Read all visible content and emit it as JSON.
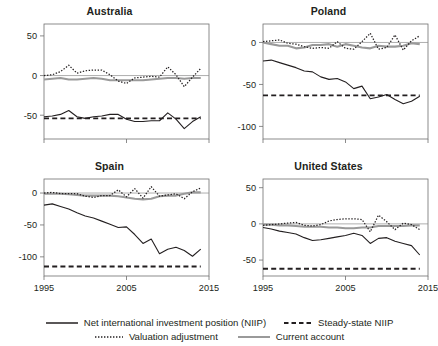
{
  "figure": {
    "background": "#ffffff",
    "text_color": "#231f20"
  },
  "legend": {
    "items": [
      {
        "key": "solid-dark-line",
        "label": "Net international investment position (NIIP)",
        "color": "#231f20",
        "style": "solid"
      },
      {
        "key": "dashed-dark-line",
        "label": "Steady-state NIIP",
        "color": "#231f20",
        "style": "dashed"
      },
      {
        "key": "dotted-dark-line",
        "label": "Valuation adjustment",
        "color": "#231f20",
        "style": "dotted"
      },
      {
        "key": "solid-gray-line",
        "label": "Current account",
        "color": "#9a9a9a",
        "style": "solid"
      }
    ]
  },
  "chart_data": [
    {
      "type": "line",
      "title": "Australia",
      "xlabel": "",
      "ylabel": "",
      "xlim": [
        1995,
        2015
      ],
      "ylim": [
        -80,
        65
      ],
      "xticks": [
        1995,
        2005,
        2015
      ],
      "xticklabels": [
        "1995",
        "2005",
        "2015"
      ],
      "yticks": [
        50,
        0,
        -50
      ],
      "yticklabels": [
        "50",
        "0",
        "-50"
      ],
      "grid": false,
      "zero_line": true,
      "show_xticklabels": false,
      "x": [
        1995,
        1996,
        1997,
        1998,
        1999,
        2000,
        2001,
        2002,
        2003,
        2004,
        2005,
        2006,
        2007,
        2008,
        2009,
        2010,
        2011,
        2012,
        2013,
        2014
      ],
      "series": [
        {
          "name": "Net international investment position (NIIP)",
          "style": "solid",
          "color": "#231f20",
          "values": [
            -52,
            -51,
            -49,
            -44,
            -52,
            -54,
            -52,
            -51,
            -49,
            -49,
            -55,
            -58,
            -58,
            -57,
            -57,
            -47,
            -55,
            -67,
            -58,
            -52
          ]
        },
        {
          "name": "Steady-state NIIP",
          "style": "dashed",
          "color": "#231f20",
          "values": [
            -54,
            -54,
            -54,
            -54,
            -54,
            -54,
            -54,
            -54,
            -54,
            -54,
            -54,
            -54,
            -54,
            -54,
            -54,
            -54,
            -54,
            -54,
            -54,
            -54
          ]
        },
        {
          "name": "Valuation adjustment",
          "style": "dotted",
          "color": "#231f20",
          "values": [
            0,
            1,
            5,
            13,
            3,
            6,
            7,
            7,
            1,
            -7,
            -10,
            -3,
            -2,
            -1,
            -2,
            11,
            1,
            -14,
            -2,
            9
          ]
        },
        {
          "name": "Current account",
          "style": "solid",
          "color": "#9a9a9a",
          "values": [
            -5,
            -4,
            -3,
            -5,
            -5,
            -4,
            -3,
            -4,
            -6,
            -6,
            -6,
            -6,
            -6,
            -5,
            -4,
            -3,
            -3,
            -4,
            -3,
            -3
          ]
        }
      ]
    },
    {
      "type": "line",
      "title": "Poland",
      "xlabel": "",
      "ylabel": "",
      "xlim": [
        1995,
        2015
      ],
      "ylim": [
        -115,
        22
      ],
      "xticks": [
        1995,
        2005,
        2015
      ],
      "xticklabels": [
        "1995",
        "2005",
        "2015"
      ],
      "yticks": [
        0,
        -50,
        -100
      ],
      "yticklabels": [
        "0",
        "-50",
        "-100"
      ],
      "grid": false,
      "zero_line": true,
      "show_xticklabels": false,
      "x": [
        1995,
        1996,
        1997,
        1998,
        1999,
        2000,
        2001,
        2002,
        2003,
        2004,
        2005,
        2006,
        2007,
        2008,
        2009,
        2010,
        2011,
        2012,
        2013,
        2014
      ],
      "series": [
        {
          "name": "Net international investment position (NIIP)",
          "style": "solid",
          "color": "#231f20",
          "values": [
            -22,
            -21,
            -24,
            -27,
            -30,
            -34,
            -35,
            -41,
            -44,
            -43,
            -47,
            -55,
            -52,
            -67,
            -65,
            -62,
            -68,
            -73,
            -70,
            -64
          ]
        },
        {
          "name": "Steady-state NIIP",
          "style": "dashed",
          "color": "#231f20",
          "values": [
            -63,
            -63,
            -63,
            -63,
            -63,
            -63,
            -63,
            -63,
            -63,
            -63,
            -63,
            -63,
            -63,
            -63,
            -63,
            -63,
            -63,
            -63,
            -63,
            -63
          ]
        },
        {
          "name": "Valuation adjustment",
          "style": "dotted",
          "color": "#231f20",
          "values": [
            1,
            2,
            3,
            -1,
            -2,
            -5,
            -7,
            -6,
            -7,
            1,
            -7,
            -8,
            1,
            11,
            -8,
            -6,
            9,
            -9,
            2,
            8
          ]
        },
        {
          "name": "Current account",
          "style": "solid",
          "color": "#9a9a9a",
          "values": [
            0,
            -2,
            -4,
            -4,
            -7,
            -6,
            -3,
            -3,
            -2,
            -5,
            -2,
            -4,
            -6,
            -7,
            -4,
            -5,
            -5,
            -4,
            -1,
            -2
          ]
        }
      ]
    },
    {
      "type": "line",
      "title": "Spain",
      "xlabel": "",
      "ylabel": "",
      "xlim": [
        1995,
        2015
      ],
      "ylim": [
        -130,
        22
      ],
      "xticks": [
        1995,
        2005,
        2015
      ],
      "xticklabels": [
        "1995",
        "2005",
        "2015"
      ],
      "yticks": [
        0,
        -50,
        -100
      ],
      "yticklabels": [
        "0",
        "-50",
        "-100"
      ],
      "grid": false,
      "zero_line": true,
      "show_xticklabels": true,
      "x": [
        1995,
        1996,
        1997,
        1998,
        1999,
        2000,
        2001,
        2002,
        2003,
        2004,
        2005,
        2006,
        2007,
        2008,
        2009,
        2010,
        2011,
        2012,
        2013,
        2014
      ],
      "series": [
        {
          "name": "Net international investment position (NIIP)",
          "style": "solid",
          "color": "#231f20",
          "values": [
            -19,
            -17,
            -21,
            -25,
            -31,
            -36,
            -39,
            -44,
            -49,
            -54,
            -53,
            -65,
            -79,
            -72,
            -95,
            -88,
            -85,
            -90,
            -99,
            -88
          ]
        },
        {
          "name": "Steady-state NIIP",
          "style": "dashed",
          "color": "#231f20",
          "values": [
            -115,
            -115,
            -115,
            -115,
            -115,
            -115,
            -115,
            -115,
            -115,
            -115,
            -115,
            -115,
            -115,
            -115,
            -115,
            -115,
            -115,
            -115,
            -115,
            -115
          ]
        },
        {
          "name": "Valuation adjustment",
          "style": "dotted",
          "color": "#231f20",
          "values": [
            0,
            1,
            -1,
            -1,
            -1,
            -5,
            -7,
            -4,
            -4,
            5,
            -6,
            7,
            -8,
            10,
            -5,
            -3,
            -1,
            -9,
            2,
            8
          ]
        },
        {
          "name": "Current account",
          "style": "solid",
          "color": "#9a9a9a",
          "values": [
            -1,
            -1,
            -1,
            -2,
            -3,
            -4,
            -4,
            -4,
            -4,
            -5,
            -7,
            -9,
            -10,
            -9,
            -5,
            -4,
            -4,
            -1,
            1,
            1
          ]
        }
      ]
    },
    {
      "type": "line",
      "title": "United States",
      "xlabel": "",
      "ylabel": "",
      "xlim": [
        1995,
        2015
      ],
      "ylim": [
        -72,
        62
      ],
      "xticks": [
        1995,
        2005,
        2015
      ],
      "xticklabels": [
        "1995",
        "2005",
        "2015"
      ],
      "yticks": [
        50,
        0,
        -50
      ],
      "yticklabels": [
        "50",
        "0",
        "-50"
      ],
      "grid": false,
      "zero_line": true,
      "show_xticklabels": true,
      "x": [
        1995,
        1996,
        1997,
        1998,
        1999,
        2000,
        2001,
        2002,
        2003,
        2004,
        2005,
        2006,
        2007,
        2008,
        2009,
        2010,
        2011,
        2012,
        2013,
        2014
      ],
      "series": [
        {
          "name": "Net international investment position (NIIP)",
          "style": "solid",
          "color": "#231f20",
          "values": [
            -5,
            -7,
            -10,
            -12,
            -14,
            -19,
            -23,
            -22,
            -20,
            -18,
            -16,
            -13,
            -16,
            -27,
            -20,
            -19,
            -24,
            -27,
            -30,
            -43
          ]
        },
        {
          "name": "Steady-state NIIP",
          "style": "dashed",
          "color": "#231f20",
          "values": [
            -62,
            -62,
            -62,
            -62,
            -62,
            -62,
            -62,
            -62,
            -62,
            -62,
            -62,
            -62,
            -62,
            -62,
            -62,
            -62,
            -62,
            -62,
            -62,
            -62
          ]
        },
        {
          "name": "Valuation adjustment",
          "style": "dotted",
          "color": "#231f20",
          "values": [
            -2,
            -1,
            0,
            1,
            2,
            -2,
            -3,
            -1,
            4,
            6,
            7,
            7,
            6,
            -11,
            12,
            3,
            -8,
            1,
            -1,
            -8
          ]
        },
        {
          "name": "Current account",
          "style": "solid",
          "color": "#9a9a9a",
          "values": [
            -1,
            -1,
            -2,
            -2,
            -3,
            -4,
            -4,
            -4,
            -5,
            -5,
            -6,
            -6,
            -5,
            -5,
            -3,
            -3,
            -3,
            -3,
            -2,
            -2
          ]
        }
      ]
    }
  ]
}
